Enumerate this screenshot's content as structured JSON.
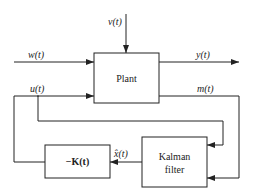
{
  "blocks": {
    "plant": "Plant",
    "gain": "−K(t)",
    "kalman_line1": "Kalman",
    "kalman_line2": "filter"
  },
  "signals": {
    "v": "v(t)",
    "w": "w(t)",
    "y": "y(t)",
    "u": "u(t)",
    "m": "m(t)",
    "xhat": "x̂(t)"
  },
  "colors": {
    "line": "#222222",
    "background": "#ffffff"
  }
}
